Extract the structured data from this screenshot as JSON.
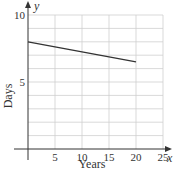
{
  "chart_data": {
    "type": "line",
    "title": "",
    "xlabel": "Years",
    "ylabel": "Days",
    "x_axis_var": "x",
    "y_axis_var": "y",
    "xlim": [
      0,
      25
    ],
    "ylim": [
      0,
      10
    ],
    "x_ticks": [
      5,
      10,
      15,
      20,
      25
    ],
    "y_ticks": [
      5,
      10
    ],
    "grid": true,
    "x_grid_step": 5,
    "y_grid_step": 1,
    "series": [
      {
        "name": "line",
        "x": [
          0,
          20
        ],
        "y": [
          8,
          6.5
        ],
        "color": "#333333"
      }
    ]
  },
  "labels": {
    "xlabel": "Years",
    "ylabel": "Days",
    "x_var": "x",
    "y_var": "y",
    "x_ticks": [
      "5",
      "10",
      "15",
      "20",
      "25"
    ],
    "y_ticks": [
      "5",
      "10"
    ]
  }
}
